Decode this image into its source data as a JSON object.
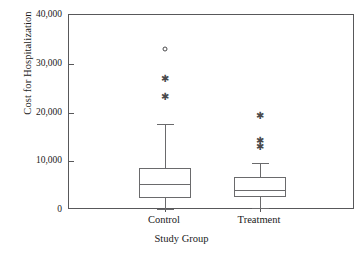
{
  "chart_data": {
    "type": "box",
    "title": "",
    "xlabel": "Study Group",
    "ylabel": "Cost for Hospitalization",
    "ylim": [
      0,
      40000
    ],
    "yticks": [
      0,
      10000,
      20000,
      30000,
      40000
    ],
    "ytick_labels": [
      "0",
      "10,000",
      "20,000",
      "30,000",
      "40,000"
    ],
    "categories": [
      "Control",
      "Treatment"
    ],
    "grid": false,
    "legend": "none",
    "boxes": [
      {
        "category": "Control",
        "whisker_low": 300,
        "q1": 2460,
        "median": 5300,
        "q3": 8600,
        "whisker_high": 17600,
        "outliers": [
          {
            "value": 23200,
            "marker": "asterisk"
          },
          {
            "value": 26800,
            "marker": "asterisk"
          },
          {
            "value": 33000,
            "marker": "circle"
          }
        ]
      },
      {
        "category": "Treatment",
        "whisker_low": 450,
        "q1": 2700,
        "median": 4100,
        "q3": 6800,
        "whisker_high": 9600,
        "outliers": [
          {
            "value": 12900,
            "marker": "asterisk"
          },
          {
            "value": 14200,
            "marker": "asterisk"
          },
          {
            "value": 19300,
            "marker": "asterisk"
          }
        ]
      }
    ]
  },
  "axes": {
    "y_title": "Cost for Hospitalization",
    "x_title": "Study Group",
    "y_labels": [
      "40,000",
      "30,000",
      "20,000",
      "10,000",
      "0"
    ],
    "x_labels": [
      "Control",
      "Treatment"
    ]
  },
  "style": {
    "frame_color": "#58585a",
    "box_color": "#6a6a6c",
    "marker_color": "#4a4a4c",
    "background": "#ffffff"
  }
}
